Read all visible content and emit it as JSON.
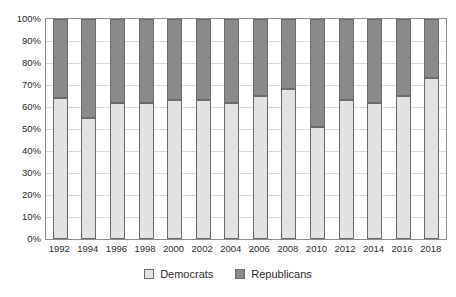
{
  "chart_data": {
    "type": "bar",
    "subtype": "stacked-100-percent",
    "title": "",
    "xlabel": "",
    "ylabel": "",
    "ylim": [
      0,
      100
    ],
    "ytick_labels": [
      "0%",
      "10%",
      "20%",
      "30%",
      "40%",
      "50%",
      "60%",
      "70%",
      "80%",
      "90%",
      "100%"
    ],
    "ytick_values": [
      0,
      10,
      20,
      30,
      40,
      50,
      60,
      70,
      80,
      90,
      100
    ],
    "grid": true,
    "legend_position": "bottom-center",
    "categories": [
      "1992",
      "1994",
      "1996",
      "1998",
      "2000",
      "2002",
      "2004",
      "2006",
      "2008",
      "2010",
      "2012",
      "2014",
      "2016",
      "2018"
    ],
    "series": [
      {
        "name": "Democrats",
        "color": "#e2e2e2",
        "values": [
          64,
          55,
          62,
          62,
          63,
          63,
          62,
          65,
          68,
          51,
          63,
          62,
          65,
          73
        ]
      },
      {
        "name": "Republicans",
        "color": "#8a8a8a",
        "values": [
          36,
          45,
          38,
          38,
          37,
          37,
          38,
          35,
          32,
          49,
          37,
          38,
          35,
          27
        ]
      }
    ]
  },
  "legend": {
    "items": [
      {
        "label": "Democrats",
        "swatch": "dem"
      },
      {
        "label": "Republicans",
        "swatch": "rep"
      }
    ]
  }
}
